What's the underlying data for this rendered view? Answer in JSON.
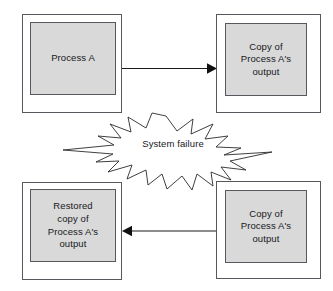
{
  "diagram": {
    "background_color": "#ffffff",
    "box_fill_color": "#d9d9d9",
    "box_outer_fill_color": "#ffffff",
    "stroke_color": "#55585c",
    "line_color": "#1a1a1a",
    "nodes": [
      {
        "id": "process-a",
        "label": "Process A",
        "position": "top-left"
      },
      {
        "id": "copy-output-top",
        "label": "Copy of\nProcess A's\noutput",
        "position": "top-right"
      },
      {
        "id": "restored-copy",
        "label": "Restored\ncopy of\nProcess A's\noutput",
        "position": "bottom-left"
      },
      {
        "id": "copy-output-bottom",
        "label": "Copy of\nProcess A's\noutput",
        "position": "bottom-right"
      }
    ],
    "connectors": [
      {
        "id": "arrow-top",
        "from": "process-a",
        "to": "copy-output-top",
        "direction": "right"
      },
      {
        "id": "arrow-bottom",
        "from": "copy-output-bottom",
        "to": "restored-copy",
        "direction": "left"
      }
    ],
    "burst": {
      "id": "system-failure-burst",
      "label": "System failure",
      "shape": "explosion-star"
    }
  }
}
